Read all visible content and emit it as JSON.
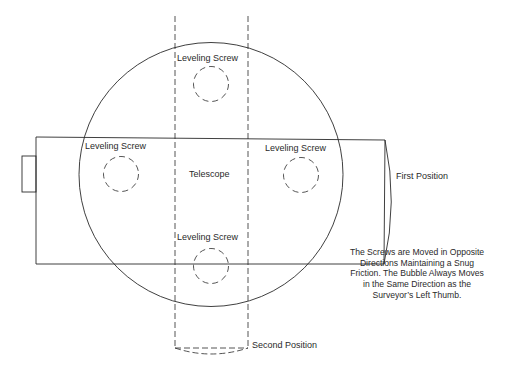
{
  "diagram": {
    "labels": {
      "screw_top": "Leveling Screw",
      "screw_left": "Leveling Screw",
      "screw_right": "Leveling Screw",
      "screw_bottom": "Leveling Screw",
      "telescope": "Telescope",
      "first_position": "First Position",
      "second_position": "Second Position"
    },
    "note": {
      "lines": [
        "The Screws are Moved in Opposite",
        "Directions Maintaining a Snug",
        "Friction.  The Bubble Always Moves",
        "in the Same Direction as the",
        "Surveyor’s Left Thumb."
      ]
    },
    "colors": {
      "line": "#2a2a2a",
      "background": "#ffffff"
    }
  }
}
